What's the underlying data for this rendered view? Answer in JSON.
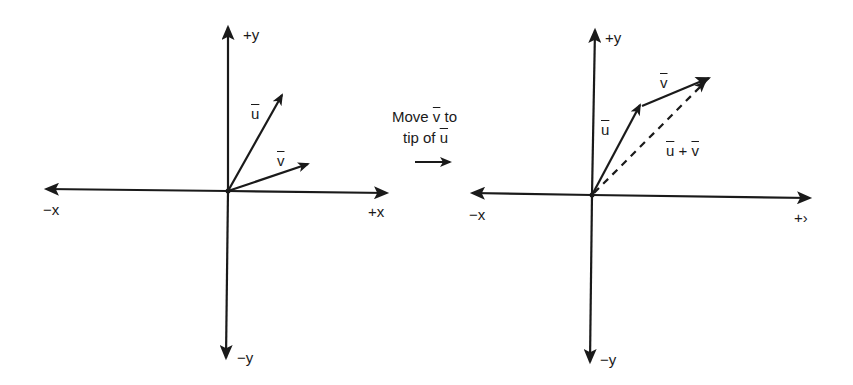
{
  "colors": {
    "ink": "#1a1a1a",
    "background": "#ffffff"
  },
  "left_panel": {
    "axes": {
      "pos_y": "+y",
      "neg_y": "−y",
      "pos_x": "+x",
      "neg_x": "−x"
    },
    "vectors": {
      "u": {
        "label": "u",
        "style": "solid"
      },
      "v": {
        "label": "v",
        "style": "solid"
      }
    }
  },
  "transition": {
    "line1_prefix": "Move ",
    "line1_vec": "v",
    "line1_suffix": " to",
    "line2_prefix": "tip of ",
    "line2_vec": "u",
    "arrow": "right-arrow"
  },
  "right_panel": {
    "axes": {
      "pos_y": "+y",
      "neg_y": "−y",
      "pos_x": "+›",
      "neg_x": "−x"
    },
    "vectors": {
      "u": {
        "label": "u",
        "style": "solid"
      },
      "v": {
        "label": "v",
        "style": "solid",
        "placed_at": "tip of u"
      },
      "sum": {
        "label_a": "u",
        "op": " + ",
        "label_b": "v",
        "style": "dashed"
      }
    }
  }
}
